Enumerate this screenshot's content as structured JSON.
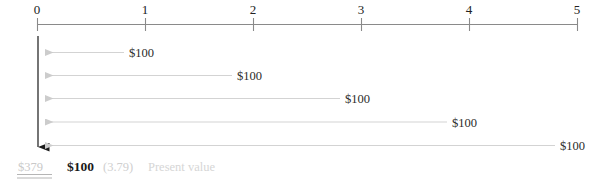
{
  "figure": {
    "kind": "cash-flow-timeline",
    "axis": {
      "tick_labels": [
        "0",
        "1",
        "2",
        "3",
        "4",
        "5"
      ],
      "axis_color": "#8a8a8a",
      "tick_color": "#8a8a8a"
    },
    "cash_flows": [
      {
        "period": 1,
        "label": "$100"
      },
      {
        "period": 2,
        "label": "$100"
      },
      {
        "period": 3,
        "label": "$100"
      },
      {
        "period": 4,
        "label": "$100"
      },
      {
        "period": 5,
        "label": "$100"
      }
    ],
    "arrow_color": "#d3d3d3",
    "discount_arrow_color": "#1a1a1a",
    "summary": {
      "total_label": "$379",
      "amount_label": "$100",
      "factor_label": "(3.79)",
      "caption_label": "Present value"
    }
  }
}
